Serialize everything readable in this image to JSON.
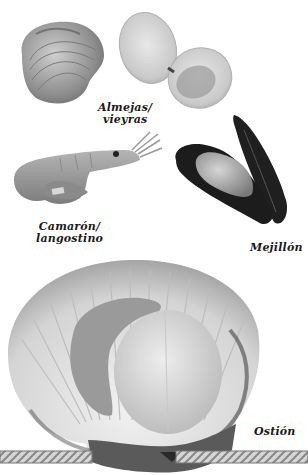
{
  "labels": {
    "clams": {
      "line1": "Almejas/",
      "line2": "vieyras"
    },
    "shrimp": {
      "line1": "Camarón/",
      "line2": "langostino"
    },
    "mussel": {
      "line1": "Mejillón"
    },
    "scallop": {
      "line1": "Ostión"
    }
  },
  "colors": {
    "background": "#ffffff",
    "label_text": "#1a1a1a",
    "mussel_shell": "#1c1c1c",
    "shell_light": "#d9d9d9",
    "rope": "#9a9a9a"
  }
}
